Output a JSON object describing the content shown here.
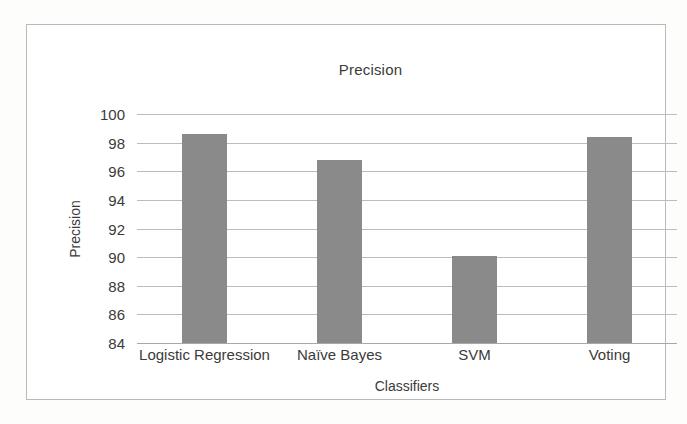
{
  "chart_data": {
    "type": "bar",
    "title": "Precision",
    "xlabel": "Classifiers",
    "ylabel": "Precision",
    "categories": [
      "Logistic Regression",
      "Naïve Bayes",
      "SVM",
      "Voting"
    ],
    "values": [
      98.6,
      96.8,
      90.1,
      98.4
    ],
    "ylim": [
      84,
      100
    ],
    "ytick_step": 2,
    "yticks": [
      100,
      98,
      96,
      94,
      92,
      90,
      88,
      86,
      84
    ],
    "ytick_labels": [
      "100",
      "98",
      "96",
      "94",
      "92",
      "90",
      "88",
      "86",
      "84"
    ],
    "grid": true,
    "legend": null,
    "legend_position": "none",
    "series": [
      {
        "name": "Precision",
        "values": [
          98.6,
          96.8,
          90.1,
          98.4
        ],
        "color": "#8a8a8a"
      }
    ],
    "colors": {
      "bar": "#8a8a8a",
      "gridline": "#bcbcbc",
      "axis": "#a8a8a8",
      "text": "#3b3b3b",
      "frame": "#b9b9b9",
      "background": "#ffffff"
    }
  }
}
